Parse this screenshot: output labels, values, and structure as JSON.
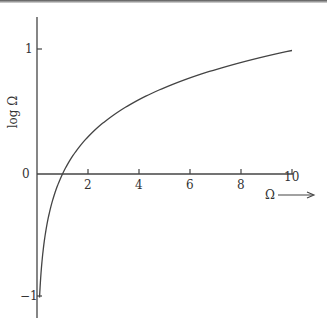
{
  "chart_data": {
    "type": "line",
    "title": "",
    "xlabel": "Ω",
    "ylabel": "log Ω",
    "x_ticks": [
      "2",
      "4",
      "6",
      "8",
      "10"
    ],
    "y_ticks": [
      "1",
      "0",
      "−1"
    ],
    "xlim": [
      0,
      10
    ],
    "ylim": [
      -1.15,
      1.25
    ],
    "grid": false,
    "legend": null,
    "series": [
      {
        "name": "log Ω",
        "x": [
          0.1,
          0.2,
          0.5,
          1,
          2,
          3,
          4,
          5,
          6,
          7,
          8,
          9,
          10
        ],
        "values": [
          -1.0,
          -0.7,
          -0.3,
          0.0,
          0.301,
          0.477,
          0.602,
          0.699,
          0.778,
          0.845,
          0.903,
          0.954,
          1.0
        ]
      }
    ]
  },
  "labels": {
    "y_axis": "log Ω",
    "x_axis": "Ω",
    "tick_x_2": "2",
    "tick_x_4": "4",
    "tick_x_6": "6",
    "tick_x_8": "8",
    "tick_x_10": "10",
    "tick_y_1": "1",
    "tick_y_0": "0",
    "tick_y_neg1": "−1"
  }
}
